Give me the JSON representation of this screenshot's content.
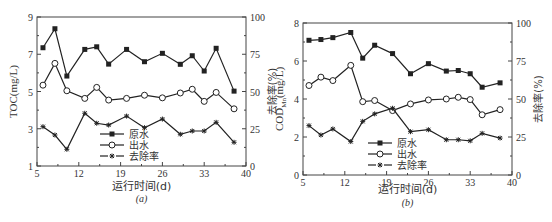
{
  "chart_data": [
    {
      "id": "a",
      "type": "line",
      "caption": "(a)",
      "title": "",
      "xlabel": "运行时间(d)",
      "ylabel": "TOC(mg/L)",
      "ylabel_right": "去除率(%)",
      "xlim": [
        5,
        40
      ],
      "xticks": [
        5,
        12,
        19,
        26,
        33,
        40
      ],
      "ylim": [
        1,
        9
      ],
      "yticks": [
        1,
        3,
        5,
        7,
        9
      ],
      "ylim_right": [
        0,
        100
      ],
      "yticks_right": [
        0,
        25,
        50,
        75,
        100
      ],
      "grid": false,
      "legend_position": "lower-center",
      "x": [
        6,
        8,
        10,
        13,
        15,
        17,
        20,
        23,
        26,
        29,
        31,
        33,
        35,
        38
      ],
      "series": [
        {
          "name": "原水",
          "axis": "left",
          "marker": "filled-square",
          "line": "solid",
          "values": [
            7.35,
            8.37,
            5.83,
            7.26,
            7.4,
            6.47,
            7.26,
            6.6,
            7.05,
            6.46,
            6.92,
            6.1,
            7.32,
            5.02
          ]
        },
        {
          "name": "出水",
          "axis": "left",
          "marker": "open-circle",
          "line": "solid",
          "values": [
            5.34,
            6.51,
            5.04,
            4.63,
            5.22,
            4.54,
            4.63,
            4.8,
            4.66,
            4.92,
            5.12,
            4.47,
            4.95,
            4.07
          ]
        },
        {
          "name": "去除率",
          "axis": "right",
          "marker": "star",
          "line": "dashed",
          "values": [
            26.4,
            20.8,
            11.2,
            35.4,
            28.7,
            27.5,
            33.5,
            25.7,
            31.5,
            21.3,
            23.5,
            23.5,
            29.3,
            15.9
          ]
        }
      ]
    },
    {
      "id": "b",
      "type": "line",
      "caption": "(b)",
      "title": "",
      "xlabel": "运行时间(d)",
      "ylabel": "COD",
      "ylabel_sub": "Mn",
      "ylabel_unit": "(mg/L)",
      "ylabel_right": "去除率(%)",
      "xlim": [
        5,
        40
      ],
      "xticks": [
        5,
        12,
        19,
        26,
        33,
        40
      ],
      "ylim": [
        0,
        8
      ],
      "yticks": [
        0,
        2,
        4,
        6,
        8
      ],
      "ylim_right": [
        0,
        100
      ],
      "yticks_right": [
        0,
        25,
        50,
        75,
        100
      ],
      "grid": false,
      "legend_position": "lower-center",
      "x": [
        6,
        8,
        10,
        13,
        15,
        17,
        20,
        23,
        26,
        29,
        31,
        33,
        35,
        38
      ],
      "series": [
        {
          "name": "原水",
          "axis": "left",
          "marker": "filled-square",
          "line": "solid",
          "values": [
            7.09,
            7.13,
            7.23,
            7.5,
            6.15,
            6.83,
            6.39,
            5.33,
            5.86,
            5.47,
            5.5,
            5.33,
            4.62,
            4.85
          ]
        },
        {
          "name": "出水",
          "axis": "left",
          "marker": "open-circle",
          "line": "solid",
          "values": [
            4.71,
            5.15,
            4.97,
            5.77,
            3.86,
            3.92,
            3.39,
            3.74,
            3.95,
            4.0,
            4.09,
            3.97,
            3.17,
            3.44
          ]
        },
        {
          "name": "去除率",
          "axis": "right",
          "marker": "star",
          "line": "dashed",
          "values": [
            32.5,
            26.3,
            30.3,
            22.0,
            35.3,
            40.2,
            43.9,
            28.5,
            29.8,
            23.2,
            23.2,
            22.5,
            27.4,
            24.3
          ]
        }
      ]
    }
  ],
  "layout": {
    "panels": [
      {
        "left": 37,
        "right": 246,
        "top": 17,
        "bottom": 166,
        "legend_x": 100,
        "legend_y": 134,
        "caption_y": 202,
        "xlabel_y": 190
      },
      {
        "left": 303,
        "right": 512,
        "top": 23,
        "bottom": 175,
        "legend_x": 368,
        "legend_y": 143,
        "caption_y": 206,
        "xlabel_y": 193
      }
    ],
    "colors": {
      "line": "#222222",
      "axis": "#444444",
      "text": "#333333"
    }
  }
}
